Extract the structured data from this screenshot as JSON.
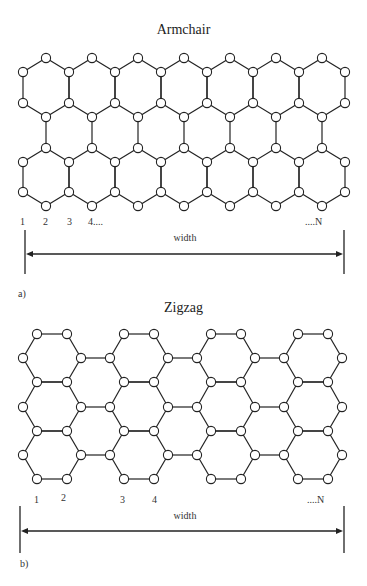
{
  "figure": {
    "panel_a": {
      "title": "Armchair",
      "panel_label": "a)",
      "width_label": "width",
      "index_labels": [
        "1",
        "2",
        "3",
        "4....",
        "....N"
      ]
    },
    "panel_b": {
      "title": "Zigzag",
      "panel_label": "b)",
      "width_label": "width",
      "index_labels": [
        "1",
        "2",
        "3",
        "4",
        "....N"
      ]
    }
  },
  "style": {
    "line_color": "#222222",
    "atom_fill": "#ffffff",
    "atom_stroke": "#222222"
  }
}
